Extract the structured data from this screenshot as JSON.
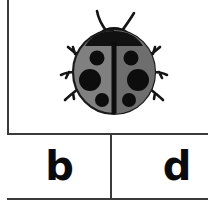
{
  "worksheet": {
    "type": "picture-letter-match-card",
    "picture": {
      "subject_name": "ladybug",
      "alt_text": "ladybug",
      "colors": {
        "body_left_wing": "#808080",
        "body_right_wing": "#6e6e6e",
        "outline": "#1a1a1a",
        "spots": "#0d0d0d",
        "head": "#111111",
        "legs": "#151515",
        "antennae": "#151515",
        "background": "#ffffff"
      },
      "spot_count": 6,
      "leg_count": 6,
      "antenna_count": 2
    },
    "answer_row": {
      "cells": [
        {
          "id": "choice-b",
          "letter": "b"
        },
        {
          "id": "choice-d",
          "letter": "d"
        }
      ]
    },
    "borders": {
      "color": "#3a3a3a",
      "thickness_px": 2
    }
  }
}
